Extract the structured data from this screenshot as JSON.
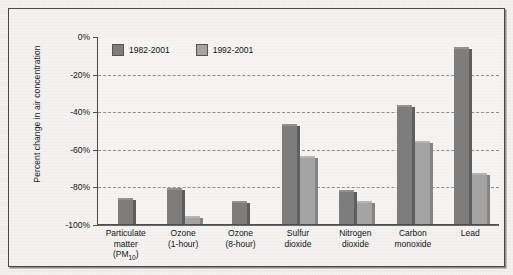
{
  "chart_data": {
    "type": "bar",
    "title": "",
    "xlabel": "",
    "ylabel": "Percent change in air concentration",
    "ylim": [
      -100,
      0
    ],
    "yticks": [
      "0%",
      "-20%",
      "-40%",
      "-60%",
      "-80%",
      "-100%"
    ],
    "ytick_values": [
      0,
      -20,
      -40,
      -60,
      -80,
      -100
    ],
    "grid": true,
    "legend_position": "top-left-inside",
    "categories": [
      "Particulate matter (PM10)",
      "Ozone (1-hour)",
      "Ozone (8-hour)",
      "Sulfur dioxide",
      "Nitrogen dioxide",
      "Carbon monoxide",
      "Lead"
    ],
    "category_label_lines": [
      [
        "Particulate",
        "matter",
        "(PM10)"
      ],
      [
        "Ozone",
        "(1-hour)"
      ],
      [
        "Ozone",
        "(8-hour)"
      ],
      [
        "Sulfur",
        "dioxide"
      ],
      [
        "Nitrogen",
        "dioxide"
      ],
      [
        "Carbon",
        "monoxide"
      ],
      [
        "Lead"
      ]
    ],
    "series": [
      {
        "name": "1982-2001",
        "color": "#7d7d7d",
        "values": [
          -13,
          -18,
          -11,
          -52,
          -17,
          -62,
          -93
        ]
      },
      {
        "name": "1992-2001",
        "color": "#a4a4a4",
        "values": [
          0,
          -3,
          0,
          -35,
          -11,
          -43,
          -26
        ]
      }
    ]
  },
  "axis": {
    "y_title": "Percent change in air concentration",
    "ticks": [
      {
        "label": "-100%",
        "value": -100
      },
      {
        "label": "-80%",
        "value": -80
      },
      {
        "label": "-60%",
        "value": -60
      },
      {
        "label": "-40%",
        "value": -40
      },
      {
        "label": "-20%",
        "value": -20
      },
      {
        "label": "0%",
        "value": 0
      }
    ]
  },
  "legend": {
    "items": [
      {
        "label": "1982-2001",
        "color": "#7d7d7d"
      },
      {
        "label": "1992-2001",
        "color": "#a4a4a4"
      }
    ]
  },
  "colors": {
    "series_1982_2001": "#7d7d7d",
    "series_1992_2001": "#a4a4a4",
    "frame": "#4a4a4a",
    "gridline": "#8e8e8e",
    "background": "#f3f2f0"
  }
}
